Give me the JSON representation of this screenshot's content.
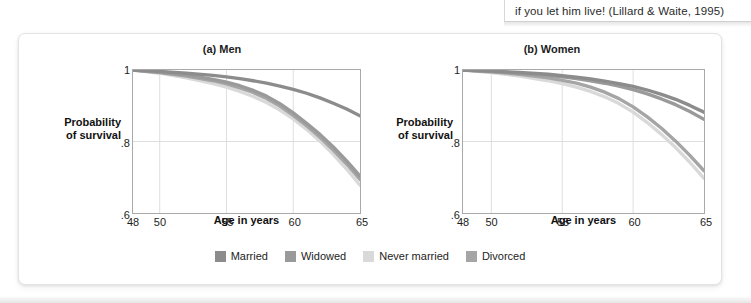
{
  "caption": {
    "text": "if you let him live! (Lillard & Waite, 1995)"
  },
  "legend": {
    "items": [
      {
        "label": "Married",
        "color": "#8c8c8c"
      },
      {
        "label": "Widowed",
        "color": "#9a9a9a"
      },
      {
        "label": "Never married",
        "color": "#d9d9d9"
      },
      {
        "label": "Divorced",
        "color": "#a5a5a5"
      }
    ]
  },
  "chart_data": [
    {
      "type": "line",
      "id": "men",
      "title": "(a) Men",
      "xlabel": "Age in years",
      "ylabel": "Probability of survival",
      "ylabel_lines": [
        "Probability",
        "of survival"
      ],
      "xlim": [
        48,
        65
      ],
      "ylim": [
        0.6,
        1.0
      ],
      "xticks": [
        48,
        50,
        55,
        60,
        65
      ],
      "xticklabels": [
        "48",
        "50",
        "55",
        "60",
        "65"
      ],
      "yticks": [
        0.6,
        0.8,
        1.0
      ],
      "yticklabels": [
        ".6",
        ".8",
        "1"
      ],
      "grid": true,
      "legend_position": "below-figure",
      "x": [
        48,
        50,
        52,
        54,
        55,
        56,
        57,
        58,
        59,
        60,
        61,
        62,
        63,
        64,
        65
      ],
      "series": [
        {
          "name": "Married",
          "color": "#8c8c8c",
          "values": [
            1.0,
            0.996,
            0.991,
            0.985,
            0.981,
            0.976,
            0.97,
            0.963,
            0.955,
            0.946,
            0.935,
            0.922,
            0.907,
            0.891,
            0.872
          ]
        },
        {
          "name": "Widowed",
          "color": "#9a9a9a",
          "values": [
            1.0,
            0.994,
            0.986,
            0.974,
            0.966,
            0.956,
            0.943,
            0.927,
            0.906,
            0.88,
            0.851,
            0.82,
            0.785,
            0.746,
            0.703
          ]
        },
        {
          "name": "Never married",
          "color": "#d9d9d9",
          "values": [
            1.0,
            0.991,
            0.978,
            0.962,
            0.952,
            0.94,
            0.926,
            0.909,
            0.888,
            0.863,
            0.834,
            0.801,
            0.764,
            0.723,
            0.678
          ]
        },
        {
          "name": "Divorced",
          "color": "#a5a5a5",
          "values": [
            1.0,
            0.993,
            0.983,
            0.97,
            0.961,
            0.95,
            0.937,
            0.92,
            0.899,
            0.873,
            0.844,
            0.812,
            0.776,
            0.737,
            0.694
          ]
        }
      ]
    },
    {
      "type": "line",
      "id": "women",
      "title": "(b) Women",
      "xlabel": "Age in years",
      "ylabel": "Probability of survival",
      "ylabel_lines": [
        "Probability",
        "of survival"
      ],
      "xlim": [
        48,
        65
      ],
      "ylim": [
        0.6,
        1.0
      ],
      "xticks": [
        48,
        50,
        55,
        60,
        65
      ],
      "xticklabels": [
        "48",
        "50",
        "55",
        "60",
        "65"
      ],
      "yticks": [
        0.6,
        0.8,
        1.0
      ],
      "yticklabels": [
        ".6",
        ".8",
        "1"
      ],
      "grid": true,
      "legend_position": "below-figure",
      "x": [
        48,
        50,
        52,
        54,
        55,
        56,
        57,
        58,
        59,
        60,
        61,
        62,
        63,
        64,
        65
      ],
      "series": [
        {
          "name": "Married",
          "color": "#8c8c8c",
          "values": [
            1.0,
            0.997,
            0.993,
            0.988,
            0.984,
            0.98,
            0.975,
            0.969,
            0.962,
            0.954,
            0.944,
            0.932,
            0.918,
            0.901,
            0.882
          ]
        },
        {
          "name": "Widowed",
          "color": "#9a9a9a",
          "values": [
            1.0,
            0.996,
            0.991,
            0.985,
            0.981,
            0.976,
            0.97,
            0.963,
            0.955,
            0.945,
            0.933,
            0.919,
            0.903,
            0.884,
            0.862
          ]
        },
        {
          "name": "Never married",
          "color": "#d9d9d9",
          "values": [
            1.0,
            0.993,
            0.983,
            0.97,
            0.962,
            0.952,
            0.94,
            0.925,
            0.906,
            0.882,
            0.853,
            0.82,
            0.783,
            0.742,
            0.697
          ]
        },
        {
          "name": "Divorced",
          "color": "#a5a5a5",
          "values": [
            1.0,
            0.995,
            0.988,
            0.978,
            0.971,
            0.963,
            0.952,
            0.938,
            0.92,
            0.897,
            0.869,
            0.837,
            0.801,
            0.761,
            0.718
          ]
        }
      ]
    }
  ]
}
